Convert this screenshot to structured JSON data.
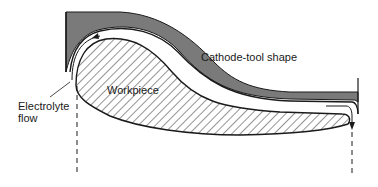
{
  "diagram": {
    "labels": {
      "cathode_tool": "Cathode-tool shape",
      "workpiece": "Workpiece",
      "electrolyte_line1": "Electrolyte",
      "electrolyte_line2": "flow"
    },
    "colors": {
      "cathode_fill": "#7a7a7a",
      "outline": "#1a1a1a",
      "hatch": "#2a2a2a",
      "background": "#ffffff"
    }
  }
}
